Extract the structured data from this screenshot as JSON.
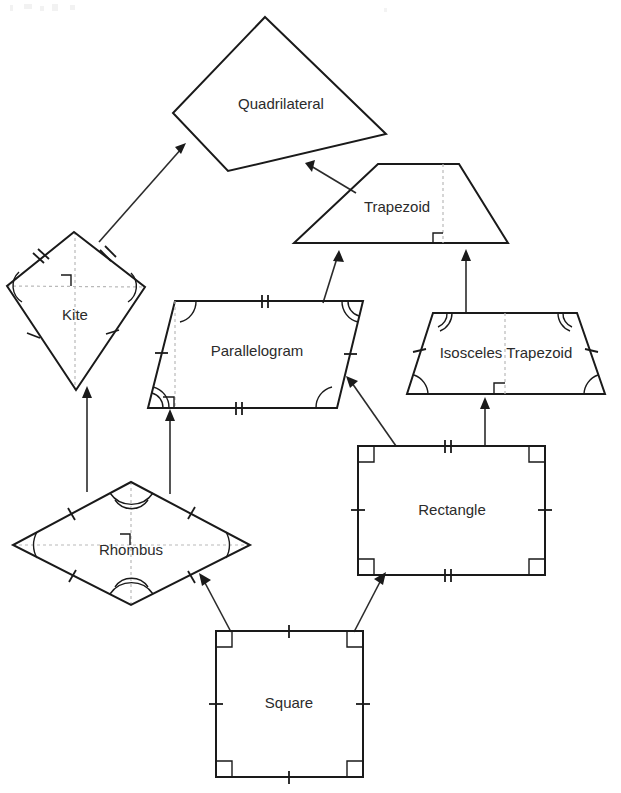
{
  "diagram": {
    "background_color": "#ffffff",
    "stroke_color": "#1a1a1a",
    "label_color": "#2b2b2b",
    "dashed_color": "#b9b9b9",
    "nodes": {
      "quadrilateral": {
        "label": "Quadrilateral",
        "label_x": 281,
        "label_y": 105,
        "points": "265,17 386,134 228,171 173,113",
        "marks": "none"
      },
      "trapezoid": {
        "label": "Trapezoid",
        "label_x": 397,
        "label_y": 208,
        "points": "378,164 459,164 508,243 294,243",
        "marks": "height-right-angle"
      },
      "kite": {
        "label": "Kite",
        "label_x": 75,
        "label_y": 316,
        "points": "74,232 145,287 76,390 7,286",
        "marks": "two-pairs-congruent-sides, congruent-angles, perpendicular-diagonals"
      },
      "parallelogram": {
        "label": "Parallelogram",
        "label_x": 257,
        "label_y": 352,
        "points": "175,301 363,301 337,408 148,408",
        "marks": "opposite-sides-congruent, opposite-angles-congruent, height-right-angle"
      },
      "isosceles_trapezoid": {
        "label": "Isosceles Trapezoid",
        "label_x": 506,
        "label_y": 354,
        "points": "433,313 577,313 605,394 407,394",
        "marks": "legs-congruent, base-angles-congruent, height-right-angle"
      },
      "rhombus": {
        "label": "Rhombus",
        "label_x": 131,
        "label_y": 551,
        "points": "131,482 250,545 131,605 13,545",
        "marks": "all-sides-congruent, opposite-angles-congruent, perpendicular-diagonals"
      },
      "rectangle": {
        "label": "Rectangle",
        "label_x": 452,
        "label_y": 511,
        "points": "358,446 545,446 545,575 358,575",
        "marks": "four-right-angles, opposite-sides-congruent"
      },
      "square": {
        "label": "Square",
        "label_x": 289,
        "label_y": 704,
        "points": "216,631 363,631 363,777 216,777",
        "marks": "four-right-angles, all-sides-congruent"
      }
    },
    "edges": [
      {
        "name": "kite-to-quadrilateral",
        "from": "kite",
        "to": "quadrilateral",
        "x1": 99,
        "y1": 242,
        "x2": 186,
        "y2": 143
      },
      {
        "name": "trapezoid-to-quadrilateral",
        "from": "trapezoid",
        "to": "quadrilateral",
        "x1": 356,
        "y1": 193,
        "x2": 306,
        "y2": 163
      },
      {
        "name": "parallelogram-to-trapezoid",
        "from": "parallelogram",
        "to": "trapezoid",
        "x1": 323,
        "y1": 303,
        "x2": 339,
        "y2": 251
      },
      {
        "name": "isosceles-trapezoid-to-trapezoid",
        "from": "isosceles_trapezoid",
        "to": "trapezoid",
        "x1": 466,
        "y1": 312,
        "x2": 466,
        "y2": 250
      },
      {
        "name": "rhombus-to-kite",
        "from": "rhombus",
        "to": "kite",
        "x1": 87,
        "y1": 492,
        "x2": 87,
        "y2": 387
      },
      {
        "name": "rhombus-to-parallelogram",
        "from": "rhombus",
        "to": "parallelogram",
        "x1": 170,
        "y1": 494,
        "x2": 170,
        "y2": 410
      },
      {
        "name": "rectangle-to-parallelogram",
        "from": "rectangle",
        "to": "parallelogram",
        "x1": 396,
        "y1": 446,
        "x2": 347,
        "y2": 377
      },
      {
        "name": "rectangle-to-isosceles-trapezoid",
        "from": "rectangle",
        "to": "isosceles_trapezoid",
        "x1": 485,
        "y1": 446,
        "x2": 485,
        "y2": 398
      },
      {
        "name": "square-to-rhombus",
        "from": "square",
        "to": "rhombus",
        "x1": 231,
        "y1": 632,
        "x2": 199,
        "y2": 574
      },
      {
        "name": "square-to-rectangle",
        "from": "square",
        "to": "rectangle",
        "x1": 354,
        "y1": 632,
        "x2": 386,
        "y2": 573
      }
    ]
  }
}
